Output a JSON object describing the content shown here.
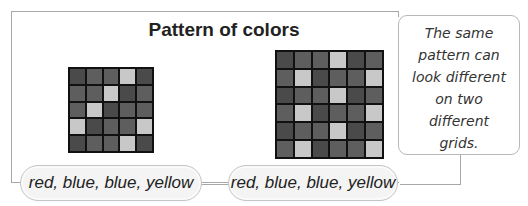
{
  "title": "Pattern of colors",
  "colors": {
    "red": "#4a4a4a",
    "blue": "#5e5e5e",
    "yellow": "#c8c8c8",
    "grid_line": "#111111"
  },
  "pattern": [
    "red",
    "blue",
    "blue",
    "yellow"
  ],
  "grids": [
    {
      "name": "left",
      "columns": 5,
      "rows": 5,
      "cells": [
        "red",
        "blue",
        "blue",
        "yellow",
        "red",
        "blue",
        "blue",
        "yellow",
        "red",
        "blue",
        "blue",
        "yellow",
        "red",
        "blue",
        "blue",
        "yellow",
        "red",
        "blue",
        "blue",
        "yellow",
        "red",
        "blue",
        "blue",
        "yellow",
        "red"
      ],
      "label": "red, blue, blue, yellow"
    },
    {
      "name": "right",
      "columns": 6,
      "rows": 6,
      "cells": [
        "red",
        "blue",
        "blue",
        "yellow",
        "red",
        "blue",
        "blue",
        "yellow",
        "red",
        "blue",
        "blue",
        "yellow",
        "red",
        "blue",
        "blue",
        "yellow",
        "red",
        "blue",
        "blue",
        "yellow",
        "red",
        "blue",
        "blue",
        "yellow",
        "red",
        "blue",
        "blue",
        "yellow",
        "red",
        "blue",
        "blue",
        "yellow",
        "red",
        "blue",
        "blue",
        "yellow"
      ],
      "label": "red, blue, blue, yellow"
    }
  ],
  "callout": {
    "lines": [
      "The same",
      "pattern can",
      "look different",
      "on two",
      "different",
      "grids."
    ]
  }
}
